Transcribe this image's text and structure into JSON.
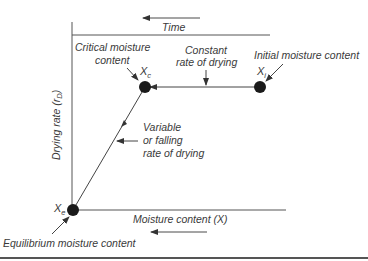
{
  "diagram": {
    "axes": {
      "y_label": "Drying rate (r",
      "y_label_sub": "D",
      "y_label_close": ")",
      "x_label": "Moisture content (X)",
      "top_label": "Time"
    },
    "points": {
      "critical": {
        "symbol": "X",
        "sub": "c",
        "caption_line1": "Critical moisture",
        "caption_line2": "content"
      },
      "initial": {
        "symbol": "X",
        "sub": "i",
        "caption": "Initial moisture content"
      },
      "equilibrium": {
        "symbol": "X",
        "sub": "e",
        "caption": "Equilibrium moisture content"
      }
    },
    "regions": {
      "constant": {
        "line1": "Constant",
        "line2": "rate of drying"
      },
      "falling": {
        "line1": "Variable",
        "line2": "or falling",
        "line3": "rate of drying"
      }
    },
    "colors": {
      "line": "#4a4a4a",
      "dot": "#1a1a1a",
      "text": "#3a3a3a",
      "rule": "#555555"
    }
  }
}
